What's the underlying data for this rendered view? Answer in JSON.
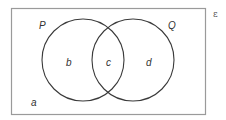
{
  "diagram": {
    "type": "venn",
    "universal_set": {
      "symbol": "ε"
    },
    "sets": [
      {
        "name": "P",
        "label": "P"
      },
      {
        "name": "Q",
        "label": "Q"
      }
    ],
    "regions": {
      "outside": {
        "label": "a",
        "description": "outside P and Q"
      },
      "p_only": {
        "label": "b",
        "description": "in P only"
      },
      "intersection": {
        "label": "c",
        "description": "in P and Q"
      },
      "q_only": {
        "label": "d",
        "description": "in Q only"
      }
    },
    "colors": {
      "stroke": "#333333",
      "frame": "#999999",
      "background": "#ffffff"
    }
  }
}
